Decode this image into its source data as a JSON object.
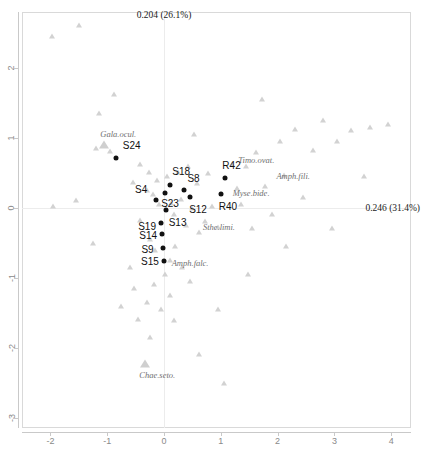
{
  "axes": {
    "caption_y": "0.204 (26.1%)",
    "caption_x": "0.246 (31.4%)",
    "x_ticks": [
      "-2",
      "-1",
      "0",
      "1",
      "2",
      "3",
      "4"
    ],
    "y_ticks": [
      "2",
      "1",
      "0",
      "-1",
      "-2",
      "-3"
    ]
  },
  "chart_data": {
    "type": "scatter",
    "title": "",
    "xlabel": "0.246 (31.4%)",
    "ylabel": "0.204 (26.1%)",
    "xlim": [
      -2.52,
      4.34
    ],
    "ylim": [
      -3.14,
      2.8
    ],
    "grid": false,
    "legend": "none",
    "annotations": [
      "0.204 (26.1%)",
      "0.246 (31.4%)"
    ],
    "x_tick_values": [
      -2,
      -1,
      0,
      1,
      2,
      3,
      4
    ],
    "y_tick_values": [
      2,
      1,
      0,
      -1,
      -2,
      -3
    ],
    "series": [
      {
        "name": "sites",
        "marker": "filled-circle",
        "color": "#111111",
        "points": [
          {
            "label": "S24",
            "x": -0.85,
            "y": 0.72,
            "label_dx": 7,
            "label_dy": -11
          },
          {
            "label": "S4",
            "x": -0.14,
            "y": 0.12,
            "label_dx": -21,
            "label_dy": -9
          },
          {
            "label": "S18",
            "x": 0.11,
            "y": 0.33,
            "label_dx": 2,
            "label_dy": -12
          },
          {
            "label": "S23",
            "x": 0.02,
            "y": 0.22,
            "label_dx": -4,
            "label_dy": 12
          },
          {
            "label": "S8",
            "x": 0.36,
            "y": 0.26,
            "label_dx": 3,
            "label_dy": -10
          },
          {
            "label": "S12",
            "x": 0.46,
            "y": 0.16,
            "label_dx": -1,
            "label_dy": 14
          },
          {
            "label": "S13",
            "x": 0.03,
            "y": -0.03,
            "label_dx": 3,
            "label_dy": 14
          },
          {
            "label": "S19",
            "x": -0.05,
            "y": -0.22,
            "label_dx": -23,
            "label_dy": 5
          },
          {
            "label": "S14",
            "x": -0.03,
            "y": -0.37,
            "label_dx": -23,
            "label_dy": 3
          },
          {
            "label": "S9",
            "x": -0.01,
            "y": -0.57,
            "label_dx": -22,
            "label_dy": 3
          },
          {
            "label": "S15",
            "x": 0.0,
            "y": -0.76,
            "label_dx": -23,
            "label_dy": 2
          },
          {
            "label": "R42",
            "x": 1.08,
            "y": 0.43,
            "label_dx": -3,
            "label_dy": -11
          },
          {
            "label": "R40",
            "x": 1.0,
            "y": 0.2,
            "label_dx": -2,
            "label_dy": 14
          }
        ]
      },
      {
        "name": "species",
        "marker": "triangle",
        "color": "#d2d2d2",
        "points": [
          {
            "label": "Gala.ocul.",
            "x": -1.05,
            "y": 0.88,
            "big": true,
            "label_dx": -4,
            "label_dy": -11
          },
          {
            "label": "Timo.ovat.",
            "x": 1.45,
            "y": 0.58,
            "big": false,
            "label_dx": -8,
            "label_dy": -6
          },
          {
            "label": "Amph.fili.",
            "x": 2.12,
            "y": 0.46,
            "big": false,
            "label_dx": -8,
            "label_dy": 1
          },
          {
            "label": "Myse.bide.",
            "x": 1.28,
            "y": 0.27,
            "big": false,
            "label_dx": -4,
            "label_dy": 5
          },
          {
            "label": "Sthe.limi.",
            "x": 0.72,
            "y": -0.2,
            "big": false,
            "label_dx": -2,
            "label_dy": 6
          },
          {
            "label": "Amph.falc.",
            "x": 0.1,
            "y": -0.76,
            "big": false,
            "label_dx": 2,
            "label_dy": 3
          },
          {
            "label": "Chae.seto.",
            "x": -0.33,
            "y": -2.24,
            "big": true,
            "label_dx": -6,
            "label_dy": 11
          }
        ]
      },
      {
        "name": "species-unlabeled",
        "marker": "triangle",
        "color": "#e2e2e2",
        "points": [
          {
            "x": -1.2,
            "y": 0.85
          },
          {
            "x": -0.95,
            "y": 0.8
          },
          {
            "x": -0.55,
            "y": 0.36
          },
          {
            "x": -0.42,
            "y": 0.62
          },
          {
            "x": -0.3,
            "y": 0.25
          },
          {
            "x": -0.26,
            "y": 0.5
          },
          {
            "x": -0.2,
            "y": 0.18
          },
          {
            "x": -0.12,
            "y": 0.38
          },
          {
            "x": -0.08,
            "y": 0.05
          },
          {
            "x": 0.05,
            "y": 0.45
          },
          {
            "x": 0.12,
            "y": 0.06
          },
          {
            "x": 0.18,
            "y": -0.1
          },
          {
            "x": 0.25,
            "y": 0.5
          },
          {
            "x": 0.3,
            "y": 0.12
          },
          {
            "x": 0.38,
            "y": -0.25
          },
          {
            "x": 0.42,
            "y": 0.58
          },
          {
            "x": 0.5,
            "y": -0.02
          },
          {
            "x": 0.58,
            "y": 0.35
          },
          {
            "x": 0.62,
            "y": -0.35
          },
          {
            "x": 0.78,
            "y": 0.48
          },
          {
            "x": 0.85,
            "y": 0.02
          },
          {
            "x": 0.95,
            "y": -0.28
          },
          {
            "x": 1.2,
            "y": 0.62
          },
          {
            "x": 1.35,
            "y": 0.05
          },
          {
            "x": 1.55,
            "y": -0.3
          },
          {
            "x": 1.62,
            "y": 0.78
          },
          {
            "x": 1.78,
            "y": 0.3
          },
          {
            "x": 1.9,
            "y": -0.1
          },
          {
            "x": 2.05,
            "y": 0.95
          },
          {
            "x": 2.3,
            "y": 1.12
          },
          {
            "x": 2.45,
            "y": 0.15
          },
          {
            "x": 2.62,
            "y": 0.82
          },
          {
            "x": 2.8,
            "y": 1.25
          },
          {
            "x": 3.05,
            "y": 0.95
          },
          {
            "x": 3.3,
            "y": 1.1
          },
          {
            "x": 3.52,
            "y": 0.45
          },
          {
            "x": 3.62,
            "y": 1.15
          },
          {
            "x": 3.95,
            "y": 1.18
          },
          {
            "x": -0.42,
            "y": -0.18
          },
          {
            "x": -0.25,
            "y": -0.45
          },
          {
            "x": -0.15,
            "y": -0.62
          },
          {
            "x": 0.02,
            "y": -0.95
          },
          {
            "x": 0.2,
            "y": -0.55
          },
          {
            "x": 0.32,
            "y": -0.85
          },
          {
            "x": 0.45,
            "y": -1.05
          },
          {
            "x": 0.1,
            "y": -1.25
          },
          {
            "x": -0.18,
            "y": -1.1
          },
          {
            "x": -0.05,
            "y": -1.45
          },
          {
            "x": -0.3,
            "y": -1.35
          },
          {
            "x": -0.45,
            "y": -1.6
          },
          {
            "x": -0.52,
            "y": -1.15
          },
          {
            "x": -0.25,
            "y": -1.85
          },
          {
            "x": 0.18,
            "y": -1.62
          },
          {
            "x": -0.6,
            "y": -0.85
          },
          {
            "x": -0.75,
            "y": -1.42
          },
          {
            "x": -1.25,
            "y": -0.52
          },
          {
            "x": -1.55,
            "y": 0.1
          },
          {
            "x": -1.95,
            "y": 0.02
          },
          {
            "x": -1.15,
            "y": 1.35
          },
          {
            "x": -0.88,
            "y": 1.62
          },
          {
            "x": -1.5,
            "y": 2.6
          },
          {
            "x": -1.98,
            "y": 2.45
          },
          {
            "x": 0.52,
            "y": 1.05
          },
          {
            "x": 0.95,
            "y": -1.45
          },
          {
            "x": 1.48,
            "y": -0.95
          },
          {
            "x": 2.15,
            "y": -0.55
          },
          {
            "x": 1.05,
            "y": -2.52
          },
          {
            "x": 0.62,
            "y": -2.1
          },
          {
            "x": 2.95,
            "y": -0.3
          },
          {
            "x": 1.72,
            "y": 1.55
          }
        ]
      }
    ]
  }
}
